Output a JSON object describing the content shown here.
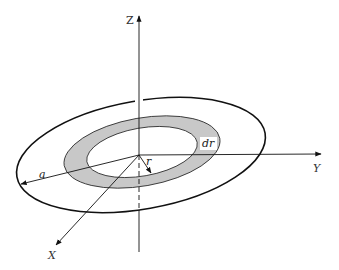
{
  "diagram": {
    "axes": {
      "x_label": "X",
      "y_label": "Y",
      "z_label": "Z"
    },
    "labels": {
      "outer_radius": "a",
      "ring_radius": "r",
      "ring_width": "dr"
    },
    "colors": {
      "ring_fill": "#c8c8c8",
      "stroke": "#111111",
      "background": "#ffffff"
    }
  }
}
